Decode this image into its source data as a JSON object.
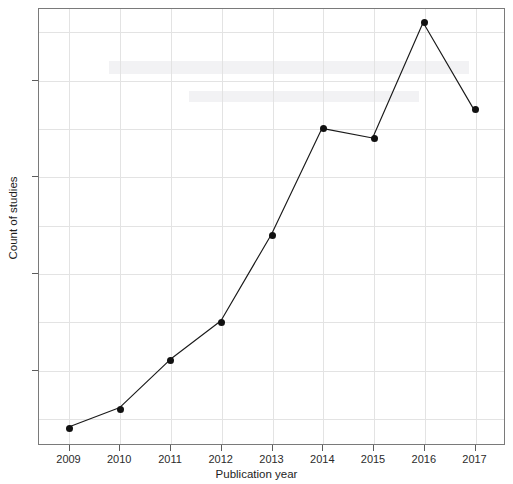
{
  "chart_data": {
    "type": "line",
    "title": "",
    "xlabel": "Publication year",
    "ylabel": "Count of studies",
    "categories": [
      "2009",
      "2010",
      "2011",
      "2012",
      "2013",
      "2014",
      "2015",
      "2016",
      "2017"
    ],
    "x": [
      2009,
      2010,
      2011,
      2012,
      2013,
      2014,
      2015,
      2016,
      2017
    ],
    "values": [
      4,
      6,
      11,
      15,
      24,
      35,
      34,
      46,
      37
    ],
    "series": [
      {
        "name": "Count of studies",
        "values": [
          4,
          6,
          11,
          15,
          24,
          35,
          34,
          46,
          37
        ],
        "marker": "filled-circle",
        "line_color": "#1a1a1a",
        "marker_color": "#111111"
      }
    ],
    "xlim": [
      2008.4,
      2017.6
    ],
    "ylim": [
      2.2,
      47.4
    ],
    "yticks": [
      10,
      20,
      30,
      40
    ],
    "ytick_labels": [
      "10",
      "20",
      "30",
      "40"
    ],
    "xticks": [
      2009,
      2010,
      2011,
      2012,
      2013,
      2014,
      2015,
      2016,
      2017
    ],
    "xtick_labels": [
      "2009",
      "2010",
      "2011",
      "2012",
      "2013",
      "2014",
      "2015",
      "2016",
      "2017"
    ],
    "y_gridlines": [
      5,
      10,
      15,
      20,
      25,
      30,
      35,
      40,
      45
    ],
    "x_gridlines": [
      2009,
      2010,
      2011,
      2012,
      2013,
      2014,
      2015,
      2016,
      2017
    ],
    "grid": true,
    "legend": false,
    "legend_position": "none",
    "annotations": [],
    "colors": {
      "background": "#ffffff",
      "grid": "#e3e3e3",
      "frame": "#7a7a7a",
      "line": "#1a1a1a",
      "marker": "#111111",
      "text": "#1d1d1d"
    }
  }
}
